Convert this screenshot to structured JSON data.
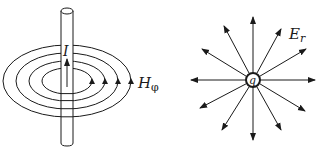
{
  "figure": {
    "left_panel": {
      "description": "Magnetic field circles around a current-carrying wire",
      "current_label": "I",
      "field_label": "H",
      "field_subscript": "φ",
      "ring_count": 4
    },
    "right_panel": {
      "description": "Radial electric field lines from a point charge",
      "charge_label": "q",
      "field_label": "E",
      "field_subscript": "r",
      "arrow_count": 14
    },
    "colors": {
      "stroke": "#1a1a1a",
      "background": "#ffffff"
    }
  }
}
